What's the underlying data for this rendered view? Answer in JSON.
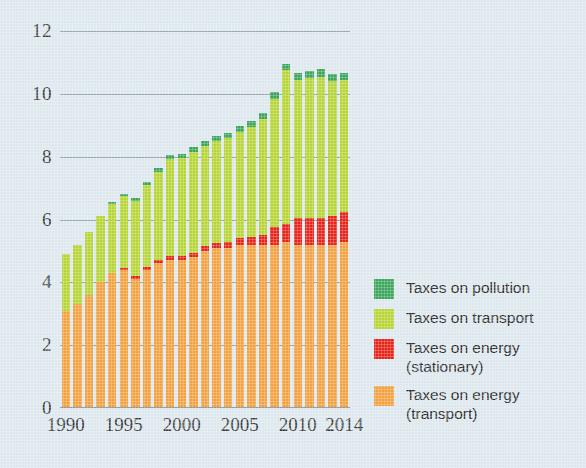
{
  "chart": {
    "type": "bar",
    "title": "",
    "background_color": "#dde8ee",
    "axis_label_color": "#3b3b3b"
  },
  "yaxis": {
    "label": "",
    "min": 0,
    "max": 12,
    "tick_values": [
      0,
      2,
      4,
      6,
      8,
      10,
      12
    ],
    "tick_labels": [
      "0",
      "2",
      "4",
      "6",
      "8",
      "10",
      "12"
    ],
    "grid": true
  },
  "xaxis": {
    "label": "",
    "tick_labels": [
      "1990",
      "1995",
      "2000",
      "2005",
      "2010",
      "2014"
    ],
    "tick_years": [
      1990,
      1995,
      2000,
      2005,
      2010,
      2014
    ]
  },
  "legend": {
    "position": "right",
    "items": [
      {
        "label": "Taxes on pollution",
        "label_line2": "",
        "color": "#3ba55c",
        "key": "pollution"
      },
      {
        "label": "Taxes on transport",
        "label_line2": "",
        "color": "#b6d534",
        "key": "transport"
      },
      {
        "label": "Taxes on energy",
        "label_line2": "(stationary)",
        "color": "#e52319",
        "key": "energy_stationary"
      },
      {
        "label": "Taxes on energy",
        "label_line2": "(transport)",
        "color": "#f3a03e",
        "key": "energy_transport"
      }
    ]
  },
  "chart_data": {
    "type": "bar",
    "stacked": true,
    "title": "",
    "xlabel": "",
    "ylabel": "",
    "ylim": [
      0,
      12
    ],
    "grid": true,
    "legend_position": "right",
    "categories": [
      "1990",
      "1991",
      "1992",
      "1993",
      "1994",
      "1995",
      "1996",
      "1997",
      "1998",
      "1999",
      "2000",
      "2001",
      "2002",
      "2003",
      "2004",
      "2005",
      "2006",
      "2007",
      "2008",
      "2009",
      "2010",
      "2011",
      "2012",
      "2013",
      "2014"
    ],
    "series": [
      {
        "name": "Taxes on energy (transport)",
        "color": "#f3a03e",
        "values": [
          3.1,
          3.3,
          3.6,
          4.0,
          4.3,
          4.4,
          4.1,
          4.4,
          4.6,
          4.7,
          4.7,
          4.8,
          5.0,
          5.1,
          5.1,
          5.2,
          5.2,
          5.2,
          5.2,
          5.3,
          5.2,
          5.2,
          5.2,
          5.2,
          5.3
        ]
      },
      {
        "name": "Taxes on energy (stationary)",
        "color": "#e52319",
        "values": [
          0.0,
          0.0,
          0.0,
          0.0,
          0.0,
          0.05,
          0.1,
          0.1,
          0.12,
          0.13,
          0.15,
          0.15,
          0.15,
          0.15,
          0.18,
          0.2,
          0.25,
          0.3,
          0.55,
          0.55,
          0.85,
          0.85,
          0.85,
          0.9,
          0.95
        ]
      },
      {
        "name": "Taxes on transport",
        "color": "#b6d534",
        "values": [
          1.8,
          1.9,
          2.0,
          2.1,
          2.2,
          2.3,
          2.4,
          2.6,
          2.8,
          3.1,
          3.1,
          3.2,
          3.2,
          3.25,
          3.3,
          3.4,
          3.5,
          3.7,
          4.1,
          4.9,
          4.4,
          4.45,
          4.5,
          4.3,
          4.2
        ]
      },
      {
        "name": "Taxes on pollution",
        "color": "#3ba55c",
        "values": [
          0.0,
          0.0,
          0.0,
          0.0,
          0.05,
          0.07,
          0.08,
          0.1,
          0.12,
          0.13,
          0.15,
          0.15,
          0.15,
          0.15,
          0.17,
          0.18,
          0.18,
          0.2,
          0.2,
          0.2,
          0.22,
          0.22,
          0.25,
          0.22,
          0.2
        ]
      }
    ],
    "totals": [
      4.9,
      5.2,
      5.6,
      6.1,
      6.55,
      6.82,
      6.68,
      7.2,
      7.64,
      8.06,
      8.1,
      8.3,
      8.5,
      8.65,
      8.75,
      8.98,
      9.13,
      9.4,
      10.05,
      10.95,
      10.67,
      10.72,
      10.8,
      10.62,
      10.65
    ]
  }
}
